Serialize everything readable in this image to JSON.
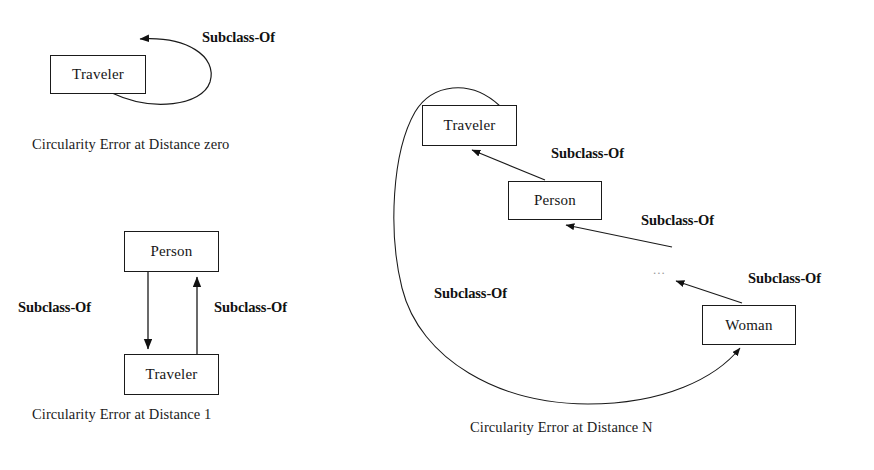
{
  "canvas": {
    "width": 874,
    "height": 470,
    "background": "#ffffff",
    "stroke": "#1a1a1a"
  },
  "diagrams": [
    {
      "id": "distance-zero",
      "caption": "Circularity Error at Distance zero",
      "nodes": [
        {
          "id": "traveler",
          "label": "Traveler",
          "x": 50,
          "y": 55,
          "w": 96,
          "h": 39
        }
      ],
      "edges": [
        {
          "id": "self-loop",
          "label": "Subclass-Of",
          "from": "traveler",
          "to": "traveler",
          "kind": "self-loop"
        }
      ]
    },
    {
      "id": "distance-1",
      "caption": "Circularity Error at Distance 1",
      "nodes": [
        {
          "id": "person",
          "label": "Person",
          "x": 124,
          "y": 231,
          "w": 95,
          "h": 41
        },
        {
          "id": "traveler",
          "label": "Traveler",
          "x": 124,
          "y": 354,
          "w": 95,
          "h": 41
        }
      ],
      "edges": [
        {
          "id": "person-to-traveler",
          "label": "Subclass-Of",
          "from": "person",
          "to": "traveler",
          "kind": "straight-down"
        },
        {
          "id": "traveler-to-person",
          "label": "Subclass-Of",
          "from": "traveler",
          "to": "person",
          "kind": "straight-up"
        }
      ]
    },
    {
      "id": "distance-n",
      "caption": "Circularity Error at Distance N",
      "ellipsis": "...",
      "nodes": [
        {
          "id": "traveler",
          "label": "Traveler",
          "x": 422,
          "y": 105,
          "w": 95,
          "h": 41
        },
        {
          "id": "person",
          "label": "Person",
          "x": 508,
          "y": 181,
          "w": 94,
          "h": 39
        },
        {
          "id": "woman",
          "label": "Woman",
          "x": 702,
          "y": 305,
          "w": 94,
          "h": 40
        }
      ],
      "edges": [
        {
          "id": "person-to-traveler",
          "label": "Subclass-Of",
          "from": "person",
          "to": "traveler",
          "kind": "diagonal"
        },
        {
          "id": "chain-to-person",
          "label": "Subclass-Of",
          "from": "ellipsis",
          "to": "person",
          "kind": "diagonal"
        },
        {
          "id": "woman-to-chain",
          "label": "Subclass-Of",
          "from": "woman",
          "to": "ellipsis",
          "kind": "diagonal"
        },
        {
          "id": "woman-to-traveler",
          "label": "Subclass-Of",
          "from": "traveler",
          "to": "woman",
          "kind": "long-curve"
        }
      ]
    }
  ],
  "labels": {
    "d0_subclass_of": "Subclass-Of",
    "d0_caption": "Circularity Error at Distance zero",
    "d1_subclass_of_left": "Subclass-Of",
    "d1_subclass_of_right": "Subclass-Of",
    "d1_caption": "Circularity Error at Distance 1",
    "dn_subclass_of_1": "Subclass-Of",
    "dn_subclass_of_2": "Subclass-Of",
    "dn_subclass_of_3": "Subclass-Of",
    "dn_subclass_of_left": "Subclass-Of",
    "dn_caption": "Circularity Error at Distance N",
    "dn_ellipsis": "..."
  },
  "nodes": {
    "d0_traveler": "Traveler",
    "d1_person": "Person",
    "d1_traveler": "Traveler",
    "dn_traveler": "Traveler",
    "dn_person": "Person",
    "dn_woman": "Woman"
  }
}
